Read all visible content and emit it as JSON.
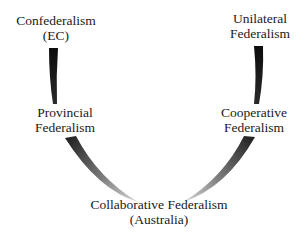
{
  "diagram": {
    "type": "federalism-spectrum-u-curve",
    "nodes": {
      "confederalism": {
        "line1": "Confederalism",
        "line2": "(EC)"
      },
      "unilateral": {
        "line1": "Unilateral",
        "line2": "Federalism"
      },
      "provincial": {
        "line1": "Provincial",
        "line2": "Federalism"
      },
      "cooperative": {
        "line1": "Cooperative",
        "line2": "Federalism"
      },
      "collaborative": {
        "line1": "Collaborative Federalism",
        "line2": "(Australia)"
      }
    },
    "colors": {
      "arc_dark": "#111111",
      "arc_light": "#d0d0d0",
      "text": "#1a1a1a",
      "background": "#ffffff"
    }
  }
}
